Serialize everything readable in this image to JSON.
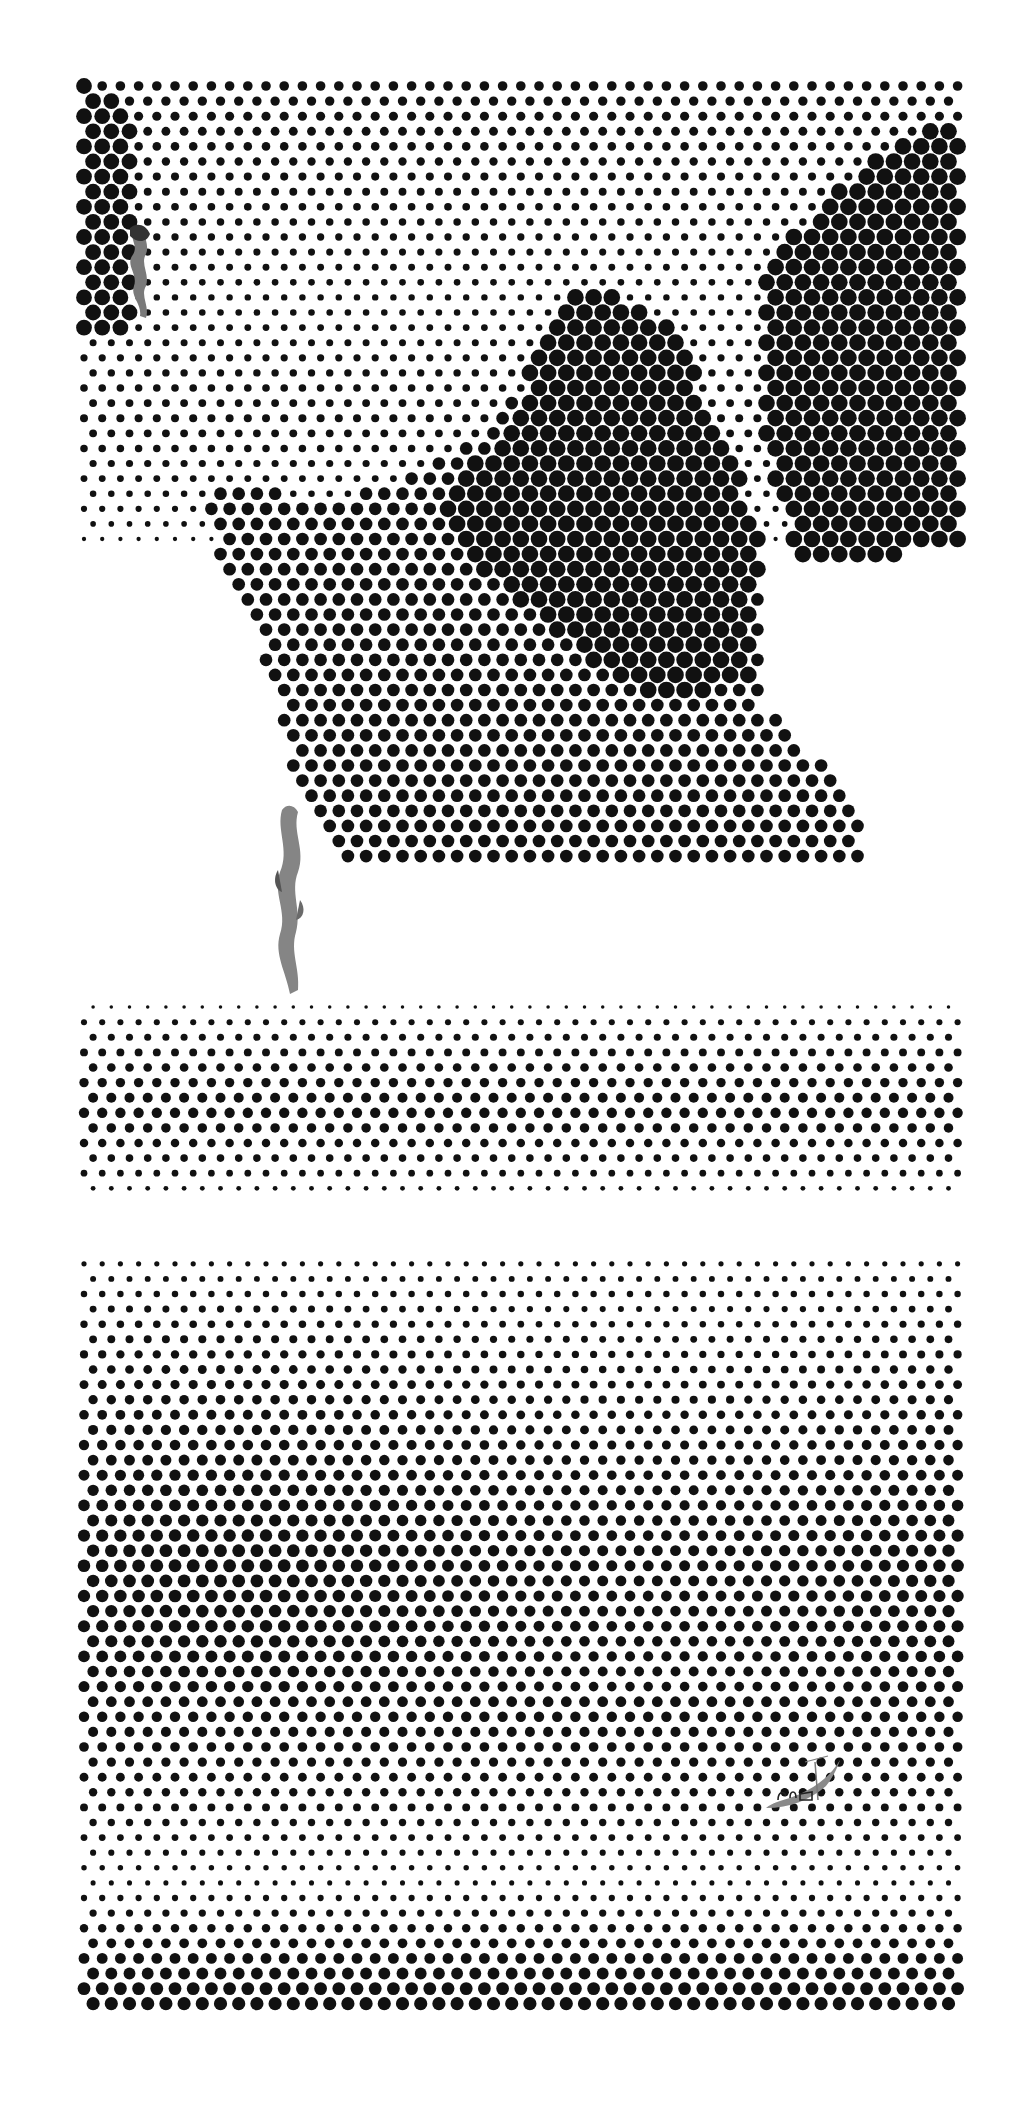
{
  "artwork": {
    "title": "Halftone landscape with mountains, reeds and fisherman's boat",
    "frame": {
      "x": 80,
      "y": 82,
      "width": 882,
      "height": 1935
    },
    "background": "#ffffff",
    "dot_color": "#111111",
    "grid": {
      "col_pitch": 18.2,
      "row_pitch": 15.1,
      "stagger": 9.1,
      "max_radius": 9.0
    },
    "base_density_bands": [
      {
        "y": 82,
        "d": 0.32
      },
      {
        "y": 180,
        "d": 0.22
      },
      {
        "y": 300,
        "d": 0.14
      },
      {
        "y": 420,
        "d": 0.22
      },
      {
        "y": 520,
        "d": 0.12
      },
      {
        "y": 560,
        "d": 0.0
      },
      {
        "y": 1000,
        "d": 0.0
      },
      {
        "y": 1020,
        "d": 0.12
      },
      {
        "y": 1110,
        "d": 0.38
      },
      {
        "y": 1150,
        "d": 0.22
      },
      {
        "y": 1185,
        "d": 0.12
      },
      {
        "y": 1195,
        "d": 0.0
      },
      {
        "y": 1250,
        "d": 0.0
      },
      {
        "y": 1265,
        "d": 0.1
      },
      {
        "y": 1400,
        "d": 0.3
      },
      {
        "y": 1560,
        "d": 0.55
      },
      {
        "y": 1640,
        "d": 0.5
      },
      {
        "y": 1760,
        "d": 0.3
      },
      {
        "y": 1880,
        "d": 0.08
      },
      {
        "y": 1920,
        "d": 0.2
      },
      {
        "y": 2000,
        "d": 0.62
      },
      {
        "y": 2017,
        "d": 0.5
      }
    ],
    "shapes": [
      {
        "name": "left-cliff",
        "density": 0.85,
        "points": [
          [
            80,
            82
          ],
          [
            118,
            90
          ],
          [
            132,
            140
          ],
          [
            135,
            330
          ],
          [
            126,
            330
          ],
          [
            80,
            330
          ]
        ]
      },
      {
        "name": "central-mountain-shadow",
        "density": 0.55,
        "points": [
          [
            205,
            480
          ],
          [
            330,
            500
          ],
          [
            420,
            470
          ],
          [
            500,
            420
          ],
          [
            560,
            330
          ],
          [
            575,
            290
          ],
          [
            630,
            310
          ],
          [
            680,
            330
          ],
          [
            700,
            420
          ],
          [
            740,
            500
          ],
          [
            760,
            560
          ],
          [
            760,
            700
          ],
          [
            800,
            740
          ],
          [
            850,
            800
          ],
          [
            870,
            860
          ],
          [
            600,
            860
          ],
          [
            350,
            860
          ],
          [
            290,
            790
          ],
          [
            280,
            700
          ],
          [
            250,
            620
          ],
          [
            220,
            560
          ]
        ]
      },
      {
        "name": "central-mountain-peak",
        "density": 0.95,
        "points": [
          [
            548,
            322
          ],
          [
            585,
            285
          ],
          [
            640,
            310
          ],
          [
            690,
            330
          ],
          [
            700,
            400
          ],
          [
            735,
            470
          ],
          [
            760,
            520
          ],
          [
            752,
            680
          ],
          [
            660,
            700
          ],
          [
            560,
            640
          ],
          [
            470,
            560
          ],
          [
            440,
            520
          ],
          [
            470,
            470
          ],
          [
            520,
            400
          ]
        ]
      },
      {
        "name": "right-peak",
        "density": 0.95,
        "points": [
          [
            760,
            280
          ],
          [
            820,
            200
          ],
          [
            890,
            150
          ],
          [
            940,
            120
          ],
          [
            962,
            118
          ],
          [
            962,
            540
          ],
          [
            880,
            560
          ],
          [
            800,
            560
          ],
          [
            770,
            480
          ],
          [
            760,
            380
          ]
        ]
      }
    ],
    "figures": [
      {
        "name": "reed-top-left",
        "color": "#7d7d7d",
        "x": 128,
        "y": 228,
        "w": 30,
        "h": 90
      },
      {
        "name": "reed-middle",
        "color": "#8a8a8a",
        "x": 272,
        "y": 808,
        "w": 32,
        "h": 180
      },
      {
        "name": "fishing-boat",
        "color": "#8c8c8c",
        "x": 762,
        "y": 1752,
        "w": 80,
        "h": 60
      }
    ]
  }
}
